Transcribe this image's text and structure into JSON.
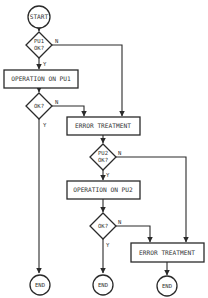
{
  "diagram": {
    "type": "flowchart",
    "colors": {
      "line": "#2a2a2a",
      "text": "#333333",
      "background": "#ffffff"
    },
    "nodes": {
      "start": {
        "label": "START",
        "shape": "circle"
      },
      "pu1_check": {
        "line1": "PU1",
        "line2": "OK?",
        "shape": "diamond"
      },
      "op_pu1": {
        "label": "OPERATION ON PU1",
        "shape": "rectangle"
      },
      "op_pu1_check": {
        "label": "OK?",
        "shape": "diamond"
      },
      "error1": {
        "label": "ERROR TREATMENT",
        "shape": "rectangle"
      },
      "pu2_check": {
        "line1": "PU2",
        "line2": "OK?",
        "shape": "diamond"
      },
      "op_pu2": {
        "label": "OPERATION ON PU2",
        "shape": "rectangle"
      },
      "op_pu2_check": {
        "label": "OK?",
        "shape": "diamond"
      },
      "error2": {
        "label": "ERROR TREATMENT",
        "shape": "rectangle"
      },
      "end1": {
        "label": "END",
        "shape": "circle"
      },
      "end2": {
        "label": "END",
        "shape": "circle"
      },
      "end3": {
        "label": "END",
        "shape": "circle"
      }
    },
    "edge_labels": {
      "yes": "Y",
      "no": "N"
    },
    "edges": [
      {
        "from": "start",
        "to": "pu1_check"
      },
      {
        "from": "pu1_check",
        "to": "op_pu1",
        "label": "Y"
      },
      {
        "from": "pu1_check",
        "to": "error1",
        "label": "N"
      },
      {
        "from": "op_pu1",
        "to": "op_pu1_check"
      },
      {
        "from": "op_pu1_check",
        "to": "end1",
        "label": "Y"
      },
      {
        "from": "op_pu1_check",
        "to": "error1",
        "label": "N"
      },
      {
        "from": "error1",
        "to": "pu2_check"
      },
      {
        "from": "pu2_check",
        "to": "op_pu2",
        "label": "Y"
      },
      {
        "from": "pu2_check",
        "to": "error2",
        "label": "N"
      },
      {
        "from": "op_pu2",
        "to": "op_pu2_check"
      },
      {
        "from": "op_pu2_check",
        "to": "end2",
        "label": "Y"
      },
      {
        "from": "op_pu2_check",
        "to": "error2",
        "label": "N"
      },
      {
        "from": "error2",
        "to": "end3"
      }
    ]
  }
}
